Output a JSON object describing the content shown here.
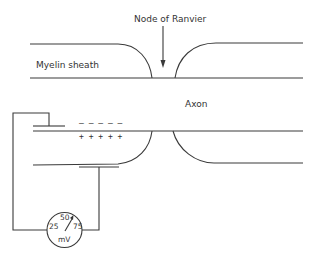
{
  "labels": {
    "node": "Node of Ranvier",
    "sheath": "Myelin sheath",
    "axon": "Axon"
  },
  "charges": {
    "negative": "– – – – –",
    "positive": "+ + + + +"
  },
  "meter": {
    "scale_left": "25",
    "scale_mid": "50",
    "scale_right": "75",
    "unit": "mV"
  }
}
